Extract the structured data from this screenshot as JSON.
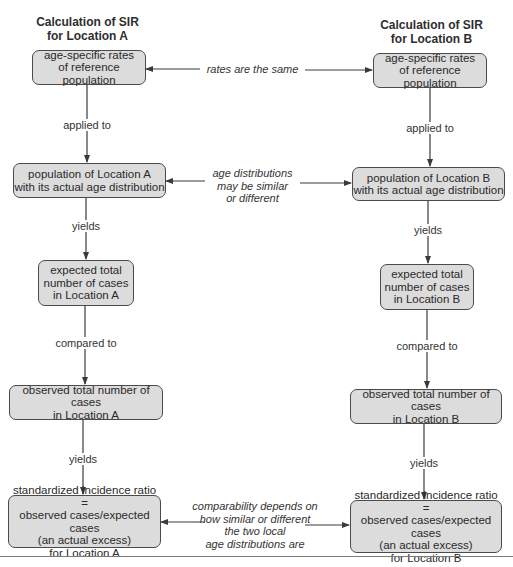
{
  "column_a": {
    "title": "Calculation of SIR\nfor Location A",
    "boxes": [
      "age-specific rates\nof reference population",
      "population of Location A\nwith its actual age distribution",
      "expected total\nnumber of cases\nin Location A",
      "observed total number of cases\nin Location A",
      "standardized incidence ratio =\nobserved cases/expected cases\n(an actual excess)\nfor Location A"
    ],
    "connectors": [
      "applied to",
      "yields",
      "compared to",
      "yields"
    ]
  },
  "column_b": {
    "title": "Calculation of SIR\nfor Location B",
    "boxes": [
      "age-specific rates\nof reference population",
      "population of Location B\nwith its actual age distribution",
      "expected total\nnumber of cases\nin Location B",
      "observed total number of cases\nin Location B",
      "standardized incidence ratio =\nobserved cases/expected cases\n(an actual excess)\nfor Location B"
    ],
    "connectors": [
      "applied to",
      "yields",
      "compared to",
      "yields"
    ]
  },
  "middle_notes": [
    "rates are the same",
    "age distributions\nmay be similar\nor different",
    "comparability depends on\nhow similar or different\nthe two local\nage distributions are"
  ],
  "colors": {
    "box_fill": "#dcdcdc",
    "box_border": "#4a4a4a",
    "arrow": "#3a3a3a"
  }
}
